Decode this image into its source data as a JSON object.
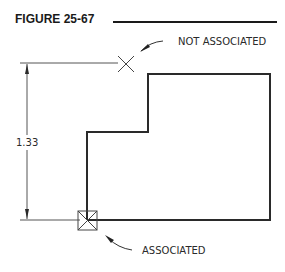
{
  "figure": {
    "title": "FIGURE 25-67"
  },
  "drawing": {
    "dimension_value": "1.33",
    "callouts": {
      "not_associated": "NOT ASSOCIATED",
      "associated": "ASSOCIATED"
    },
    "colors": {
      "line": "#2a2a2a",
      "thin_line": "#555555"
    }
  }
}
